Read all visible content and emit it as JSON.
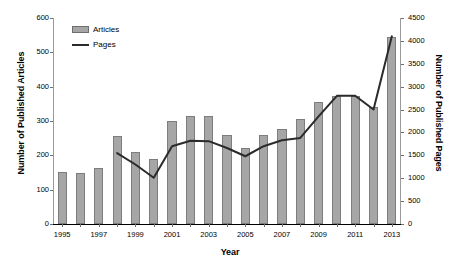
{
  "chart_data": {
    "type": "bar",
    "title": "",
    "subtitle": "",
    "xlabel": "Year",
    "ylabel": "Number of Published Articles",
    "y2label": "Number of Published Pages",
    "categories": [
      "1995",
      "1996",
      "1997",
      "1998",
      "1999",
      "2000",
      "2001",
      "2002",
      "2003",
      "2004",
      "2005",
      "2006",
      "2007",
      "2008",
      "2009",
      "2010",
      "2011",
      "2012",
      "2013"
    ],
    "xtick_labels": [
      "1995",
      "1997",
      "1999",
      "2001",
      "2003",
      "2005",
      "2007",
      "2009",
      "2011",
      "2013"
    ],
    "ylim": [
      0,
      600
    ],
    "y2lim": [
      0,
      4500
    ],
    "ytick_labels": [
      "0",
      "100",
      "200",
      "300",
      "400",
      "500",
      "600"
    ],
    "ytick_values": [
      0,
      100,
      200,
      300,
      400,
      500,
      600
    ],
    "y2tick_labels": [
      "0",
      "500",
      "1000",
      "1500",
      "2000",
      "2500",
      "3000",
      "3500",
      "4000",
      "4500"
    ],
    "y2tick_values": [
      0,
      500,
      1000,
      1500,
      2000,
      2500,
      3000,
      3500,
      4000,
      4500
    ],
    "grid": false,
    "legend_position": "top-left",
    "series": [
      {
        "name": "Articles",
        "kind": "bar",
        "axis": "left",
        "color": "#a6a6a6",
        "edge_color": "#7d7d7d",
        "values": [
          152,
          150,
          163,
          255,
          210,
          190,
          300,
          315,
          315,
          258,
          222,
          258,
          278,
          305,
          355,
          373,
          372,
          340,
          545
        ]
      },
      {
        "name": "Pages",
        "kind": "line",
        "axis": "right",
        "color": "#2b2b2b",
        "values": [
          null,
          null,
          null,
          1550,
          1300,
          1010,
          1700,
          1820,
          1810,
          1660,
          1480,
          1700,
          1830,
          1880,
          2350,
          2800,
          2800,
          2500,
          4100
        ]
      }
    ]
  },
  "legend": {
    "items": [
      {
        "label": "Articles",
        "marker": "bar-swatch"
      },
      {
        "label": "Pages",
        "marker": "line-swatch"
      }
    ]
  }
}
